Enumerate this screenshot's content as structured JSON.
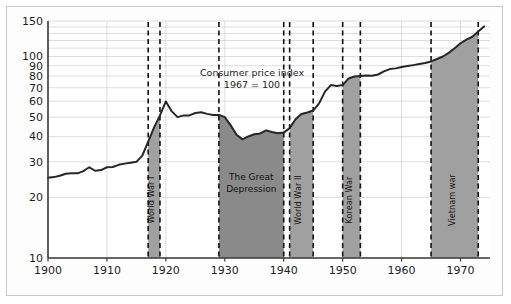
{
  "figure": {
    "background": "#ffffff",
    "frame_border_color": "#c9c9c9"
  },
  "annotation": {
    "line1": "Consumer price index",
    "line2": "1967 = 100"
  },
  "colors": {
    "line": "#262626",
    "area_fill": "#a8a8a8",
    "band_fill": "#a0a0a0",
    "depression_fill": "#8a8a8a",
    "grid": "#cfcfcf",
    "axis": "#3a3a3a",
    "dash": "#111111"
  },
  "chart_data": {
    "type": "line",
    "title": "Consumer price index",
    "subtitle": "1967 = 100",
    "xlabel": "",
    "ylabel": "",
    "yscale": "log",
    "ylim": [
      10,
      150
    ],
    "xlim": [
      1900,
      1975
    ],
    "grid": true,
    "legend": "none",
    "yticks": [
      10,
      20,
      30,
      40,
      50,
      60,
      70,
      80,
      90,
      100,
      150
    ],
    "ytick_labels": [
      "10",
      "20",
      "30",
      "40",
      "50",
      "60",
      "70",
      "80",
      "90",
      "100",
      "150"
    ],
    "xticks": [
      1900,
      1910,
      1920,
      1930,
      1940,
      1950,
      1960,
      1970
    ],
    "xtick_labels": [
      "1900",
      "1910",
      "1920",
      "1930",
      "1940",
      "1950",
      "1960",
      "1970"
    ],
    "series": [
      {
        "name": "Consumer price index",
        "x": [
          1900,
          1901,
          1902,
          1903,
          1904,
          1905,
          1906,
          1907,
          1908,
          1909,
          1910,
          1911,
          1912,
          1913,
          1914,
          1915,
          1916,
          1917,
          1918,
          1919,
          1920,
          1921,
          1922,
          1923,
          1924,
          1925,
          1926,
          1927,
          1928,
          1929,
          1930,
          1931,
          1932,
          1933,
          1934,
          1935,
          1936,
          1937,
          1938,
          1939,
          1940,
          1941,
          1942,
          1943,
          1944,
          1945,
          1946,
          1947,
          1948,
          1949,
          1950,
          1951,
          1952,
          1953,
          1954,
          1955,
          1956,
          1957,
          1958,
          1959,
          1960,
          1961,
          1962,
          1963,
          1964,
          1965,
          1966,
          1967,
          1968,
          1969,
          1970,
          1971,
          1972,
          1973,
          1974
        ],
        "values": [
          25.0,
          25.2,
          25.6,
          26.2,
          26.3,
          26.3,
          27.0,
          28.2,
          27.1,
          27.3,
          28.2,
          28.3,
          29.0,
          29.4,
          29.7,
          30.0,
          32.2,
          37.8,
          44.5,
          51.0,
          59.8,
          53.4,
          50.0,
          51.0,
          51.0,
          52.4,
          52.9,
          51.9,
          51.3,
          51.3,
          50.0,
          45.5,
          40.9,
          38.8,
          40.1,
          41.1,
          41.5,
          43.0,
          42.2,
          41.6,
          41.9,
          44.1,
          48.8,
          51.8,
          52.7,
          53.9,
          58.5,
          66.9,
          72.1,
          71.4,
          72.1,
          77.8,
          79.5,
          80.1,
          80.5,
          80.2,
          81.4,
          84.3,
          86.6,
          87.3,
          88.7,
          89.6,
          90.6,
          91.7,
          92.9,
          94.5,
          97.2,
          100.0,
          104.2,
          109.8,
          116.3,
          121.3,
          125.3,
          133.1,
          141.0
        ]
      }
    ],
    "bands": [
      {
        "label": "World War I",
        "start": 1917,
        "end": 1919,
        "fill": "#a0a0a0",
        "rotate": -90
      },
      {
        "label": "The Great Depression",
        "start": 1929,
        "end": 1940,
        "fill": "#8a8a8a",
        "rotate": 0
      },
      {
        "label": "World War II",
        "start": 1941,
        "end": 1945,
        "fill": "#a0a0a0",
        "rotate": -90
      },
      {
        "label": "Korean War",
        "start": 1950,
        "end": 1953,
        "fill": "#a0a0a0",
        "rotate": -90
      },
      {
        "label": "Vietnam war",
        "start": 1965,
        "end": 1973,
        "fill": "#a0a0a0",
        "rotate": -90
      }
    ]
  }
}
